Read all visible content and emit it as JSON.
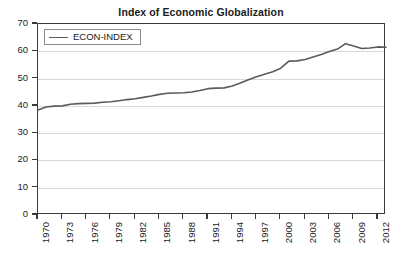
{
  "chart_data": {
    "type": "line",
    "title": "Index of Economic Globalization",
    "xlabel": "",
    "ylabel": "",
    "ylim": [
      0,
      70
    ],
    "xlim": [
      1970,
      2013
    ],
    "grid": true,
    "legend_position": "top-left",
    "y_ticks": [
      70,
      60,
      50,
      40,
      30,
      20,
      10,
      0
    ],
    "x_ticks": [
      1970,
      1973,
      1976,
      1979,
      1982,
      1985,
      1988,
      1991,
      1994,
      1997,
      2000,
      2003,
      2006,
      2009,
      2012
    ],
    "series": [
      {
        "name": "ECON-INDEX",
        "color": "#5a5a5a",
        "x": [
          1970,
          1971,
          1972,
          1973,
          1974,
          1975,
          1976,
          1977,
          1978,
          1979,
          1980,
          1981,
          1982,
          1983,
          1984,
          1985,
          1986,
          1987,
          1988,
          1989,
          1990,
          1991,
          1992,
          1993,
          1994,
          1995,
          1996,
          1997,
          1998,
          1999,
          2000,
          2001,
          2002,
          2003,
          2004,
          2005,
          2006,
          2007,
          2008,
          2009,
          2010,
          2011,
          2012,
          2013
        ],
        "values": [
          38.5,
          39.6,
          39.9,
          40.0,
          40.6,
          40.8,
          40.9,
          41.0,
          41.3,
          41.5,
          41.9,
          42.3,
          42.6,
          43.1,
          43.6,
          44.2,
          44.6,
          44.7,
          44.8,
          45.1,
          45.6,
          46.3,
          46.5,
          46.6,
          47.3,
          48.4,
          49.6,
          50.7,
          51.6,
          52.5,
          53.8,
          56.4,
          56.5,
          57.0,
          57.9,
          58.8,
          59.9,
          60.8,
          62.8,
          61.9,
          61.0,
          61.2,
          61.6,
          61.5
        ]
      }
    ]
  },
  "legend": {
    "label": "ECON-INDEX"
  }
}
